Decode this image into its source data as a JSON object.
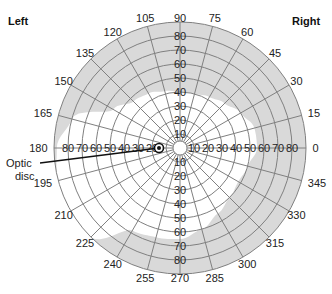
{
  "chart_data": {
    "type": "polar-visual-field",
    "title": "",
    "side_labels": {
      "left": "Left",
      "right": "Right"
    },
    "center": {
      "x": 180,
      "y": 148
    },
    "outer_radius_px": 126,
    "max_eccentricity_deg": 90,
    "ring_step_deg": 10,
    "rings": [
      10,
      20,
      30,
      40,
      50,
      60,
      70,
      80,
      90
    ],
    "radial_angles_deg": [
      0,
      15,
      30,
      45,
      60,
      75,
      90,
      105,
      120,
      135,
      150,
      165,
      180,
      195,
      210,
      225,
      240,
      255,
      270,
      285,
      300,
      315,
      330,
      345
    ],
    "angle_labels": [
      "0",
      "15",
      "30",
      "45",
      "60",
      "75",
      "90",
      "105",
      "120",
      "135",
      "150",
      "165",
      "180",
      "195",
      "210",
      "225",
      "240",
      "255",
      "270",
      "285",
      "300",
      "315",
      "330",
      "345"
    ],
    "vertical_up_labels": [
      "10",
      "20",
      "30",
      "40",
      "50",
      "60",
      "70",
      "80"
    ],
    "vertical_down_labels": [
      "10",
      "20",
      "30",
      "40",
      "50",
      "60",
      "70",
      "80"
    ],
    "horizontal_left_labels": [
      "20",
      "30",
      "40",
      "50",
      "60",
      "70",
      "80"
    ],
    "horizontal_right_labels": [
      "10",
      "20",
      "30",
      "40",
      "50",
      "60",
      "70",
      "80"
    ],
    "field_boundary_deg": [
      {
        "angle": 0,
        "ecc": 55
      },
      {
        "angle": 15,
        "ecc": 55
      },
      {
        "angle": 30,
        "ecc": 50
      },
      {
        "angle": 45,
        "ecc": 45
      },
      {
        "angle": 60,
        "ecc": 42
      },
      {
        "angle": 75,
        "ecc": 40
      },
      {
        "angle": 90,
        "ecc": 40
      },
      {
        "angle": 105,
        "ecc": 42
      },
      {
        "angle": 120,
        "ecc": 45
      },
      {
        "angle": 135,
        "ecc": 47
      },
      {
        "angle": 150,
        "ecc": 55
      },
      {
        "angle": 165,
        "ecc": 80
      },
      {
        "angle": 180,
        "ecc": 88
      },
      {
        "angle": 195,
        "ecc": 90
      },
      {
        "angle": 210,
        "ecc": 90
      },
      {
        "angle": 225,
        "ecc": 90
      },
      {
        "angle": 240,
        "ecc": 68
      },
      {
        "angle": 255,
        "ecc": 66
      },
      {
        "angle": 270,
        "ecc": 65
      },
      {
        "angle": 285,
        "ecc": 60
      },
      {
        "angle": 300,
        "ecc": 54
      },
      {
        "angle": 315,
        "ecc": 50
      },
      {
        "angle": 330,
        "ecc": 48
      },
      {
        "angle": 345,
        "ecc": 50
      }
    ],
    "annotations": [
      {
        "text": "Optic disc",
        "target_angle_deg": 180,
        "target_ecc_deg": 15
      }
    ],
    "colors": {
      "outside_field": "#d9d9d9",
      "inside_field": "#ffffff",
      "grid": "#808080"
    }
  },
  "annotation": {
    "optic_line1": "Optic",
    "optic_line2": "disc"
  },
  "labels": {
    "left": "Left",
    "right": "Right"
  }
}
